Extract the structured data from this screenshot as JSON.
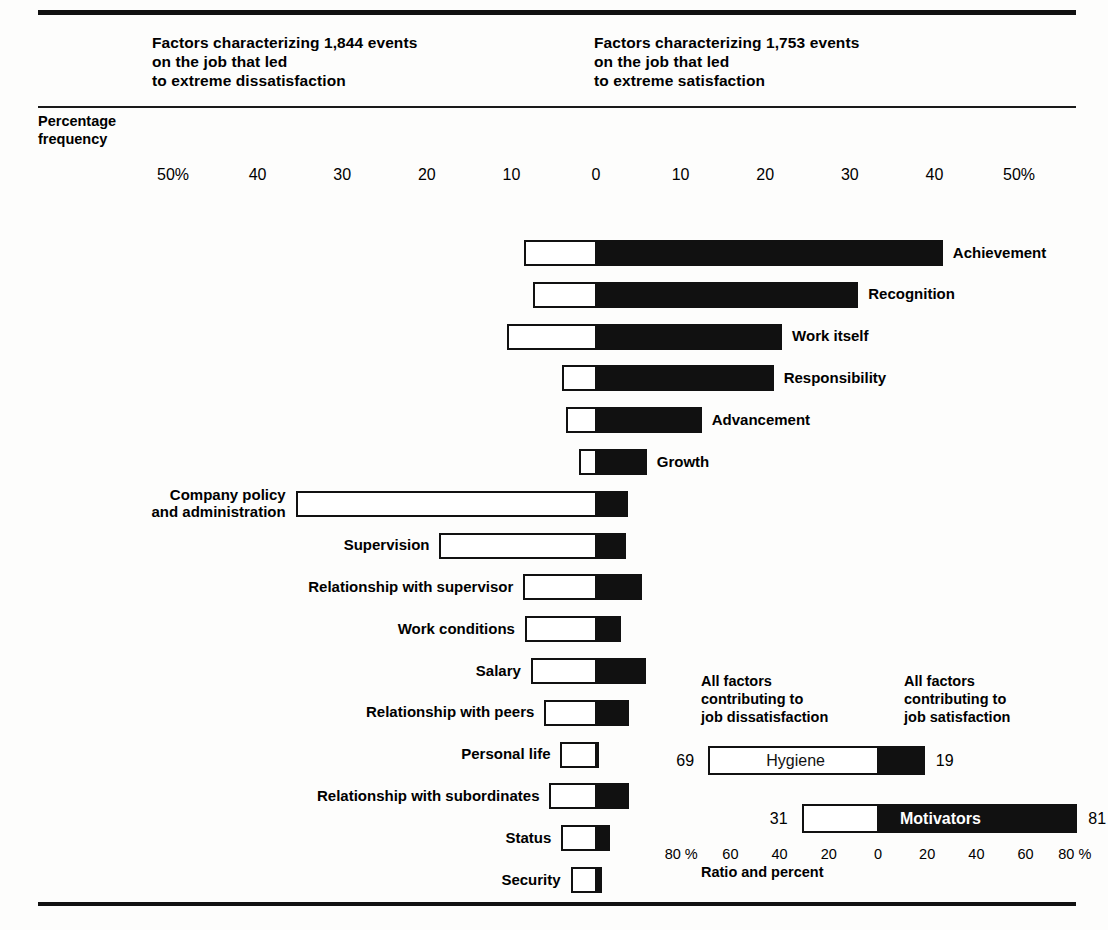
{
  "headers": {
    "left": "Factors characterizing 1,844 events\non the job that led\nto extreme dissatisfaction",
    "right": "Factors characterizing 1,753 events\non the job that led\nto extreme satisfaction",
    "axis_title": "Percentage\nfrequency"
  },
  "axis": {
    "ticks": [
      "50%",
      "40",
      "30",
      "20",
      "10",
      "0",
      "10",
      "20",
      "30",
      "40",
      "50%"
    ],
    "tick_values": [
      -50,
      -40,
      -30,
      -20,
      -10,
      0,
      10,
      20,
      30,
      40,
      50
    ]
  },
  "legend": {
    "head_left": "All factors\ncontributing to\njob dissatisfaction",
    "head_right": "All factors\ncontributing to\njob satisfaction",
    "rows": [
      {
        "name": "Hygiene",
        "left_value": "69",
        "right_value": "19",
        "text_on": "white"
      },
      {
        "name": "Motivators",
        "left_value": "31",
        "right_value": "81",
        "text_on": "black"
      }
    ],
    "ticks": [
      "80 %",
      "60",
      "40",
      "20",
      "0",
      "20",
      "40",
      "60",
      "80 %"
    ],
    "tick_values": [
      -80,
      -60,
      -40,
      -20,
      0,
      20,
      40,
      60,
      80
    ],
    "axis_label": "Ratio and percent"
  },
  "colors": {
    "bar_fill_satisfaction": "#111111",
    "bar_fill_dissatisfaction": "#ffffff",
    "bar_stroke": "#111111",
    "page_background": "#fdfdfc"
  },
  "chart_data": {
    "type": "bar",
    "xlabel": "Percentage frequency",
    "ylabel": "",
    "xlim": [
      -50,
      50
    ],
    "grid": false,
    "legend_position": "bottom-right",
    "series": [
      {
        "name": "Dissatisfaction (left, white)",
        "color": "#ffffff"
      },
      {
        "name": "Satisfaction (right, black)",
        "color": "#111111"
      }
    ],
    "categories": [
      "Achievement",
      "Recognition",
      "Work itself",
      "Responsibility",
      "Advancement",
      "Growth",
      "Company policy and administration",
      "Supervision",
      "Relationship with supervisor",
      "Work conditions",
      "Salary",
      "Relationship with peers",
      "Personal life",
      "Relationship with subordinates",
      "Status",
      "Security"
    ],
    "bars": [
      {
        "label": "Achievement",
        "label_side": "right",
        "dissatisfaction": 8.5,
        "satisfaction": 41.0
      },
      {
        "label": "Recognition",
        "label_side": "right",
        "dissatisfaction": 7.5,
        "satisfaction": 31.0
      },
      {
        "label": "Work itself",
        "label_side": "right",
        "dissatisfaction": 10.5,
        "satisfaction": 22.0
      },
      {
        "label": "Responsibility",
        "label_side": "right",
        "dissatisfaction": 4.0,
        "satisfaction": 21.0
      },
      {
        "label": "Advancement",
        "label_side": "right",
        "dissatisfaction": 3.5,
        "satisfaction": 12.5
      },
      {
        "label": "Growth",
        "label_side": "right",
        "dissatisfaction": 2.0,
        "satisfaction": 6.0
      },
      {
        "label": "Company policy\nand administration",
        "label_side": "left",
        "dissatisfaction": 35.5,
        "satisfaction": 3.8
      },
      {
        "label": "Supervision",
        "label_side": "left",
        "dissatisfaction": 18.5,
        "satisfaction": 3.5
      },
      {
        "label": "Relationship with supervisor",
        "label_side": "left",
        "dissatisfaction": 8.6,
        "satisfaction": 5.4
      },
      {
        "label": "Work conditions",
        "label_side": "left",
        "dissatisfaction": 8.4,
        "satisfaction": 3.0
      },
      {
        "label": "Salary",
        "label_side": "left",
        "dissatisfaction": 7.7,
        "satisfaction": 5.9
      },
      {
        "label": "Relationship with peers",
        "label_side": "left",
        "dissatisfaction": 6.1,
        "satisfaction": 3.9
      },
      {
        "label": "Personal life",
        "label_side": "left",
        "dissatisfaction": 4.2,
        "satisfaction": 0.4
      },
      {
        "label": "Relationship with subordinates",
        "label_side": "left",
        "dissatisfaction": 5.5,
        "satisfaction": 3.9
      },
      {
        "label": "Status",
        "label_side": "left",
        "dissatisfaction": 4.1,
        "satisfaction": 1.6
      },
      {
        "label": "Security",
        "label_side": "left",
        "dissatisfaction": 3.0,
        "satisfaction": 0.7
      }
    ]
  }
}
